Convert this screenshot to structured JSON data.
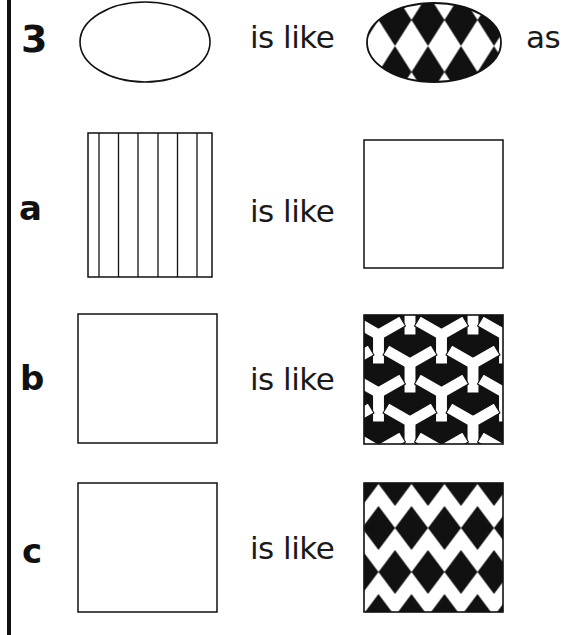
{
  "question": {
    "number": "3",
    "connector": "is like",
    "trailing": "as",
    "source_shape": "ellipse-blank",
    "target_shape": "ellipse-harlequin"
  },
  "rows": [
    {
      "label": "a",
      "connector": "is like",
      "left_figure": "square-vertical-stripes",
      "right_figure": "square-blank"
    },
    {
      "label": "b",
      "connector": "is like",
      "left_figure": "square-blank",
      "right_figure": "square-y-tessellation"
    },
    {
      "label": "c",
      "connector": "is like",
      "left_figure": "square-blank",
      "right_figure": "square-harlequin"
    }
  ],
  "colors": {
    "ink": "#111111",
    "paper": "#ffffff"
  }
}
